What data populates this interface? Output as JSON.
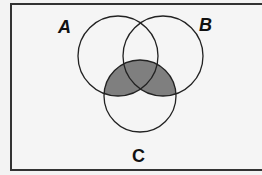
{
  "diagram": {
    "type": "venn",
    "sets": [
      {
        "id": "A",
        "label": "A"
      },
      {
        "id": "B",
        "label": "B"
      },
      {
        "id": "C",
        "label": "C"
      }
    ],
    "shaded_region": "(A ∪ B) ∩ C",
    "colors": {
      "background": "#f3f3f3",
      "border": "#333333",
      "shade": "#808080",
      "stroke": "#222222"
    }
  }
}
